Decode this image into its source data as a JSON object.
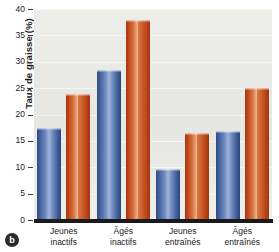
{
  "figure": {
    "panel_label": "b"
  },
  "chart_data": {
    "type": "bar",
    "title": "",
    "xlabel": "",
    "ylabel": "Taux de graisse (%)",
    "ylim": [
      0,
      40
    ],
    "yticks": [
      0,
      5,
      10,
      15,
      20,
      25,
      30,
      35,
      40
    ],
    "ytick_labels": [
      "0",
      "5",
      "10",
      "15",
      "20",
      "25",
      "30",
      "35",
      "40"
    ],
    "grid": true,
    "legend": "none",
    "categories": [
      "Jeunes inactifs",
      "Âgés inactifs",
      "Jeunes entraînés",
      "Âgés entraînés"
    ],
    "category_lines": [
      [
        "Jeunes",
        "inactifs"
      ],
      [
        "Âgés",
        "inactifs"
      ],
      [
        "Jeunes",
        "entraînés"
      ],
      [
        "Âgés",
        "entraînés"
      ]
    ],
    "series": [
      {
        "name": "series-blue",
        "color": "#4a68a6",
        "values": [
          17.4,
          28.4,
          9.7,
          16.9
        ]
      },
      {
        "name": "series-orange",
        "color": "#c4501f",
        "values": [
          23.9,
          38.0,
          16.5,
          25.0
        ]
      }
    ]
  },
  "colors": {
    "blue": "#4a68a6",
    "orange": "#c4501f",
    "plot_background": "#e9e9e6",
    "axis": "#1a1a1a"
  }
}
